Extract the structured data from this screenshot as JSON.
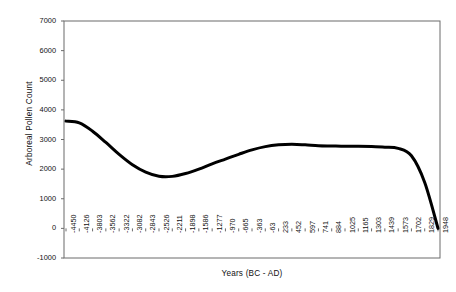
{
  "chart_data": {
    "type": "line",
    "title": "",
    "xlabel": "Years (BC - AD)",
    "ylabel": "Arboreal Pollen Count",
    "ylim": [
      -1000,
      7000
    ],
    "ytick_step": 1000,
    "yticks": [
      7000,
      6000,
      5000,
      4000,
      3000,
      2000,
      1000,
      0,
      -1000
    ],
    "ytick_labels": [
      "7000",
      "6000",
      "5000",
      "4000",
      "3000",
      "2000",
      "1000",
      "0",
      "-1000"
    ],
    "grid": false,
    "legend": false,
    "legend_position": "none",
    "series_color": "#000000",
    "line_width": 3.0,
    "categories": [
      "-4450",
      "-4126",
      "-3803",
      "-3562",
      "-3322",
      "-3082",
      "-2843",
      "-2526",
      "-2211",
      "-1898",
      "-1586",
      "-1277",
      "-970",
      "-665",
      "-363",
      "-63",
      "233",
      "452",
      "597",
      "741",
      "884",
      "1025",
      "1165",
      "1303",
      "1439",
      "1573",
      "1702",
      "1829",
      "1948"
    ],
    "series": [
      {
        "name": "Arboreal Pollen Count",
        "values": [
          3620,
          3560,
          3280,
          2900,
          2500,
          2150,
          1900,
          1760,
          1755,
          1850,
          2000,
          2180,
          2340,
          2500,
          2650,
          2760,
          2820,
          2840,
          2820,
          2790,
          2780,
          2770,
          2770,
          2760,
          2740,
          2700,
          2450,
          1550,
          0
        ]
      }
    ],
    "annotations": []
  }
}
